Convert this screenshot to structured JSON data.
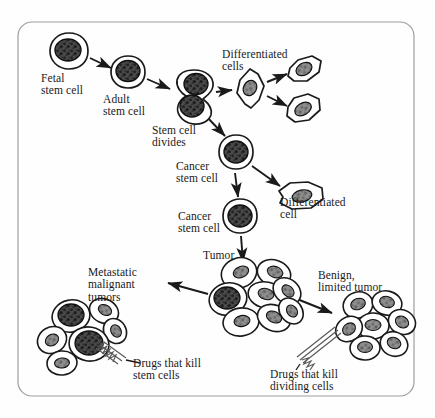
{
  "figure": {
    "background_color": "#fefefe",
    "ink_color": "#1a1a1a",
    "frame": {
      "stroke": "#9a9a9a",
      "x": 18,
      "y": 22,
      "width": 396,
      "height": 374,
      "radius": 14
    }
  },
  "labels": [
    {
      "id": "fetal-stem-cell",
      "text": "Fetal\nstem cell",
      "x": 41,
      "y": 72,
      "align": "left"
    },
    {
      "id": "adult-stem-cell",
      "text": "Adult\nstem cell",
      "x": 103,
      "y": 93,
      "align": "left"
    },
    {
      "id": "stem-cell-divides",
      "text": "Stem cell\ndivides",
      "x": 152,
      "y": 124,
      "align": "left"
    },
    {
      "id": "differentiated-cells",
      "text": "Differentiated\ncells",
      "x": 222,
      "y": 48,
      "align": "left"
    },
    {
      "id": "cancer-stem-cell-1",
      "text": "Cancer\nstem cell",
      "x": 176,
      "y": 160,
      "align": "left"
    },
    {
      "id": "differentiated-cell",
      "text": "Differentiated\ncell",
      "x": 280,
      "y": 196,
      "align": "left"
    },
    {
      "id": "cancer-stem-cell-2",
      "text": "Cancer\nstem cell",
      "x": 178,
      "y": 210,
      "align": "left"
    },
    {
      "id": "tumor",
      "text": "Tumor",
      "x": 203,
      "y": 249,
      "align": "left"
    },
    {
      "id": "metastatic-tumors",
      "text": "Metastatic\nmalignant\ntumors",
      "x": 88,
      "y": 266,
      "align": "left"
    },
    {
      "id": "benign-tumor",
      "text": "Benign,\nlimited tumor",
      "x": 318,
      "y": 269,
      "align": "left"
    },
    {
      "id": "drugs-kill-stem-cells",
      "text": "Drugs that kill\nstem cells",
      "x": 133,
      "y": 357,
      "align": "left"
    },
    {
      "id": "drugs-kill-dividing",
      "text": "Drugs that kill\ndividing cells",
      "x": 270,
      "y": 368,
      "align": "left"
    }
  ],
  "nodes": [
    {
      "id": "fetal-stem-cell-node",
      "type": "round-cell",
      "cx": 69,
      "cy": 51,
      "rx": 19,
      "ry": 18,
      "nucleus": "large-dark"
    },
    {
      "id": "adult-stem-cell-node",
      "type": "round-cell",
      "cx": 128,
      "cy": 72,
      "rx": 17,
      "ry": 16,
      "nucleus": "large-dark"
    },
    {
      "id": "dividing-stem-cell",
      "type": "dividing-cell",
      "cx": 194,
      "cy": 92,
      "rx": 20,
      "ry": 22,
      "nucleus": "two-dark"
    },
    {
      "id": "differentiated-cell-a",
      "type": "spindle-cell",
      "cx": 250,
      "cy": 88,
      "rx": 16,
      "ry": 19,
      "nucleus": "oval-gray"
    },
    {
      "id": "differentiated-cell-b",
      "type": "spindle-cell",
      "cx": 304,
      "cy": 69,
      "rx": 17,
      "ry": 13,
      "nucleus": "oval-gray"
    },
    {
      "id": "differentiated-cell-c",
      "type": "spindle-cell",
      "cx": 303,
      "cy": 109,
      "rx": 17,
      "ry": 14,
      "nucleus": "oval-gray"
    },
    {
      "id": "cancer-stem-cell-node-1",
      "type": "round-cell",
      "cx": 236,
      "cy": 152,
      "rx": 17,
      "ry": 17,
      "nucleus": "large-dark"
    },
    {
      "id": "differentiated-cell-d",
      "type": "spindle-cell",
      "cx": 301,
      "cy": 196,
      "rx": 22,
      "ry": 13,
      "nucleus": "oval-gray"
    },
    {
      "id": "cancer-stem-cell-node-2",
      "type": "round-cell",
      "cx": 240,
      "cy": 216,
      "rx": 17,
      "ry": 17,
      "nucleus": "large-dark"
    },
    {
      "id": "tumor-cluster",
      "type": "cluster",
      "cx": 248,
      "cy": 295,
      "cells": 8,
      "stem_cells": 1
    },
    {
      "id": "metastatic-cluster",
      "type": "cluster",
      "cx": 78,
      "cy": 333,
      "cells": 6,
      "stem_cells": 2
    },
    {
      "id": "benign-cluster",
      "type": "cluster",
      "cx": 372,
      "cy": 325,
      "cells": 7,
      "stem_cells": 0
    }
  ],
  "arrows": [
    {
      "id": "arrow-fetal-to-adult",
      "from": "fetal-stem-cell-node",
      "to": "adult-stem-cell-node"
    },
    {
      "id": "arrow-adult-to-dividing",
      "from": "adult-stem-cell-node",
      "to": "dividing-stem-cell"
    },
    {
      "id": "arrow-dividing-to-diff",
      "from": "dividing-stem-cell",
      "to": "differentiated-cell-a"
    },
    {
      "id": "arrow-diff-to-diff-b",
      "from": "differentiated-cell-a",
      "to": "differentiated-cell-b"
    },
    {
      "id": "arrow-diff-to-diff-c",
      "from": "differentiated-cell-a",
      "to": "differentiated-cell-c"
    },
    {
      "id": "arrow-dividing-to-cancer",
      "from": "dividing-stem-cell",
      "to": "cancer-stem-cell-node-1"
    },
    {
      "id": "arrow-cancer-to-diff-d",
      "from": "cancer-stem-cell-node-1",
      "to": "differentiated-cell-d"
    },
    {
      "id": "arrow-cancer1-to-cancer2",
      "from": "cancer-stem-cell-node-1",
      "to": "cancer-stem-cell-node-2"
    },
    {
      "id": "arrow-cancer2-to-tumor",
      "from": "cancer-stem-cell-node-2",
      "to": "tumor-cluster"
    },
    {
      "id": "arrow-tumor-to-metastatic",
      "from": "tumor-cluster",
      "to": "metastatic-cluster"
    },
    {
      "id": "arrow-tumor-to-benign",
      "from": "tumor-cluster",
      "to": "benign-cluster"
    }
  ],
  "drug_pointers": [
    {
      "id": "drug-pointer-stem-cells",
      "style": "zigzag",
      "target": "metastatic-cluster"
    },
    {
      "id": "drug-pointer-dividing-cells",
      "style": "zigzag",
      "target": "benign-cluster"
    }
  ]
}
